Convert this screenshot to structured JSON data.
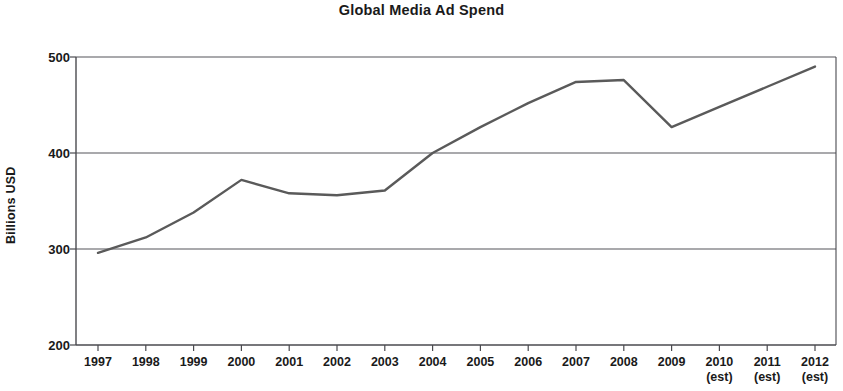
{
  "chart_data": {
    "type": "line",
    "title": "Global Media Ad Spend",
    "xlabel": "",
    "ylabel": "Billions USD",
    "ylim": [
      200,
      500
    ],
    "y_ticks": [
      200,
      300,
      400,
      500
    ],
    "grid": true,
    "legend": "none",
    "categories": [
      "1997",
      "1998",
      "1999",
      "2000",
      "2001",
      "2002",
      "2003",
      "2004",
      "2005",
      "2006",
      "2007",
      "2008",
      "2009",
      "2010",
      "2011",
      "2012"
    ],
    "category_sublabels": [
      "",
      "",
      "",
      "",
      "",
      "",
      "",
      "",
      "",
      "",
      "",
      "",
      "",
      "(est)",
      "(est)",
      "(est)"
    ],
    "series": [
      {
        "name": "Global Media Ad Spend",
        "color": "#5a5a5a",
        "values": [
          296,
          312,
          338,
          372,
          358,
          356,
          361,
          400,
          427,
          452,
          474,
          476,
          427,
          448,
          469,
          490
        ]
      }
    ],
    "annotations": []
  },
  "axis": {
    "y_tick_labels": [
      "500",
      "400",
      "300",
      "200"
    ],
    "y_title": "Billions USD"
  }
}
